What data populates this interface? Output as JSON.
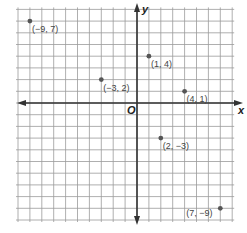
{
  "diagram": {
    "type": "coordinate-plane",
    "x_axis_label": "x",
    "y_axis_label": "y",
    "origin_label": "O",
    "grid": {
      "x_min": -10,
      "x_max": 8,
      "y_min": -10,
      "y_max": 8
    },
    "points": [
      {
        "x": -9,
        "y": 7,
        "label": "(−9, 7)"
      },
      {
        "x": -3,
        "y": 2,
        "label": "(−3, 2)"
      },
      {
        "x": 1,
        "y": 4,
        "label": "(1, 4)"
      },
      {
        "x": 4,
        "y": 1,
        "label": "(4, 1)"
      },
      {
        "x": 2,
        "y": -3,
        "label": "(2, −3)"
      },
      {
        "x": 7,
        "y": -9,
        "label": "(7, −9)"
      }
    ]
  },
  "chart_data": {
    "type": "scatter",
    "title": "",
    "xlabel": "x",
    "ylabel": "y",
    "x": [
      -9,
      -3,
      1,
      4,
      2,
      7
    ],
    "y": [
      7,
      2,
      4,
      1,
      -3,
      -9
    ],
    "point_labels": [
      "(−9, 7)",
      "(−3, 2)",
      "(1, 4)",
      "(4, 1)",
      "(2, −3)",
      "(7, −9)"
    ],
    "xlim": [
      -10,
      8
    ],
    "ylim": [
      -10,
      8
    ],
    "grid": true
  }
}
